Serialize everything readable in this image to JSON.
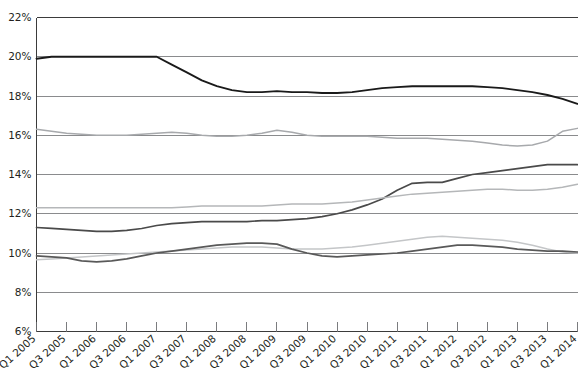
{
  "chart_data": {
    "type": "line",
    "title": "",
    "xlabel": "",
    "ylabel": "",
    "ylim": [
      6,
      22
    ],
    "ytick_labels": [
      "6%",
      "8%",
      "10%",
      "12%",
      "14%",
      "16%",
      "18%",
      "20%",
      "22%"
    ],
    "ytick_values": [
      6,
      8,
      10,
      12,
      14,
      16,
      18,
      20,
      22
    ],
    "grid": true,
    "legend": "none",
    "categories": [
      "Q1 2005",
      "Q2 2005",
      "Q3 2005",
      "Q4 2005",
      "Q1 2006",
      "Q2 2006",
      "Q3 2006",
      "Q4 2006",
      "Q1 2007",
      "Q2 2007",
      "Q3 2007",
      "Q4 2007",
      "Q1 2008",
      "Q2 2008",
      "Q3 2008",
      "Q4 2008",
      "Q1 2009",
      "Q2 2009",
      "Q3 2009",
      "Q4 2009",
      "Q1 2010",
      "Q2 2010",
      "Q3 2010",
      "Q4 2010",
      "Q1 2011",
      "Q2 2011",
      "Q3 2011",
      "Q4 2011",
      "Q1 2012",
      "Q2 2012",
      "Q3 2012",
      "Q4 2012",
      "Q1 2013",
      "Q2 2013",
      "Q3 2013",
      "Q4 2013",
      "Q1 2014"
    ],
    "xtick_labels": [
      "Q1 2005",
      "Q3 2005",
      "Q1 2006",
      "Q3 2006",
      "Q1 2007",
      "Q3 2007",
      "Q1 2008",
      "Q3 2008",
      "Q1 2009",
      "Q3 2009",
      "Q1 2010",
      "Q3 2010",
      "Q1 2011",
      "Q3 2011",
      "Q1 2012",
      "Q3 2012",
      "Q1 2013",
      "Q3 2013",
      "Q1 2014"
    ],
    "series": [
      {
        "name": "series-1",
        "color": "#1a1a1a",
        "width": 1.9,
        "values": [
          19.9,
          20.0,
          20.0,
          20.0,
          20.0,
          20.0,
          20.0,
          20.0,
          20.0,
          19.6,
          19.2,
          18.8,
          18.5,
          18.3,
          18.2,
          18.2,
          18.25,
          18.2,
          18.2,
          18.15,
          18.15,
          18.2,
          18.3,
          18.4,
          18.45,
          18.5,
          18.5,
          18.5,
          18.5,
          18.5,
          18.45,
          18.4,
          18.3,
          18.2,
          18.05,
          17.85,
          17.6
        ]
      },
      {
        "name": "series-2",
        "color": "#a7a9ac",
        "width": 1.5,
        "values": [
          16.3,
          16.2,
          16.1,
          16.05,
          16.0,
          16.0,
          16.0,
          16.05,
          16.1,
          16.15,
          16.1,
          16.0,
          15.95,
          15.95,
          16.0,
          16.1,
          16.25,
          16.15,
          16.0,
          15.95,
          15.95,
          15.95,
          15.95,
          15.9,
          15.85,
          15.85,
          15.85,
          15.8,
          15.75,
          15.7,
          15.6,
          15.5,
          15.45,
          15.5,
          15.7,
          16.2,
          16.35
        ]
      },
      {
        "name": "series-3",
        "color": "#4a4a4a",
        "width": 1.7,
        "values": [
          11.3,
          11.25,
          11.2,
          11.15,
          11.1,
          11.1,
          11.15,
          11.25,
          11.4,
          11.5,
          11.55,
          11.6,
          11.6,
          11.6,
          11.6,
          11.65,
          11.65,
          11.7,
          11.75,
          11.85,
          12.0,
          12.2,
          12.45,
          12.75,
          13.2,
          13.55,
          13.6,
          13.6,
          13.8,
          14.0,
          14.1,
          14.2,
          14.3,
          14.4,
          14.5,
          14.5,
          14.5
        ]
      },
      {
        "name": "series-4",
        "color": "#b5b7b9",
        "width": 1.5,
        "values": [
          12.3,
          12.3,
          12.3,
          12.3,
          12.3,
          12.3,
          12.3,
          12.3,
          12.3,
          12.3,
          12.35,
          12.4,
          12.4,
          12.4,
          12.4,
          12.4,
          12.45,
          12.5,
          12.5,
          12.5,
          12.55,
          12.6,
          12.7,
          12.8,
          12.9,
          13.0,
          13.05,
          13.1,
          13.15,
          13.2,
          13.25,
          13.25,
          13.2,
          13.2,
          13.25,
          13.35,
          13.5
        ]
      },
      {
        "name": "series-5",
        "color": "#c4c6c8",
        "width": 1.5,
        "values": [
          9.65,
          9.7,
          9.75,
          9.8,
          9.85,
          9.9,
          9.95,
          10.0,
          10.05,
          10.1,
          10.15,
          10.2,
          10.25,
          10.3,
          10.3,
          10.3,
          10.25,
          10.2,
          10.2,
          10.2,
          10.25,
          10.3,
          10.4,
          10.5,
          10.6,
          10.7,
          10.8,
          10.85,
          10.8,
          10.75,
          10.7,
          10.65,
          10.55,
          10.4,
          10.2,
          10.05,
          10.0
        ]
      },
      {
        "name": "series-6",
        "color": "#595959",
        "width": 1.7,
        "values": [
          9.85,
          9.8,
          9.75,
          9.6,
          9.55,
          9.6,
          9.7,
          9.85,
          10.0,
          10.1,
          10.2,
          10.3,
          10.4,
          10.45,
          10.5,
          10.5,
          10.45,
          10.2,
          10.0,
          9.85,
          9.8,
          9.85,
          9.9,
          9.95,
          10.0,
          10.1,
          10.2,
          10.3,
          10.4,
          10.4,
          10.35,
          10.3,
          10.2,
          10.15,
          10.1,
          10.1,
          10.05
        ]
      }
    ]
  },
  "axes": {
    "y_axis_name": "percentage-axis",
    "x_axis_name": "quarter-axis"
  }
}
